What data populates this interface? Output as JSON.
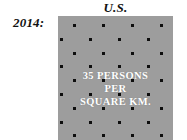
{
  "figure": {
    "country_title": "U.S.",
    "year_label": "2014:",
    "background_color": "#ffffff",
    "panel_color": "#9d9d9d",
    "dot_color": "#0d0d0d",
    "caption_color": "#ffffff",
    "text_color": "#111111"
  },
  "panel": {
    "caption_line_1": "35 PERSONS",
    "caption_line_2": "PER",
    "caption_line_3": "SQUARE KM.",
    "value": 35,
    "unit": "persons per square km.",
    "dot_rows": [
      {
        "offset": 15,
        "spacing": 29,
        "count": 4
      },
      {
        "offset": 2,
        "spacing": 29,
        "count": 4
      },
      {
        "offset": 15,
        "spacing": 29,
        "count": 4
      },
      {
        "offset": 2,
        "spacing": 29,
        "count": 4
      },
      {
        "offset": 15,
        "spacing": 29,
        "count": 4
      },
      {
        "offset": 2,
        "spacing": 29,
        "count": 4
      },
      {
        "offset": 15,
        "spacing": 29,
        "count": 4
      },
      {
        "offset": 2,
        "spacing": 29,
        "count": 4
      },
      {
        "offset": 15,
        "spacing": 29,
        "count": 4
      }
    ],
    "row_top_start": 8,
    "row_spacing": 13.8
  }
}
